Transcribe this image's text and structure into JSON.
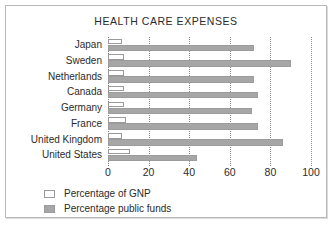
{
  "chart_data": {
    "type": "bar",
    "orientation": "horizontal",
    "title": "HEALTH CARE EXPENSES",
    "xlabel": "",
    "ylabel": "",
    "xlim": [
      0,
      100
    ],
    "xticks": [
      0,
      20,
      40,
      60,
      80,
      100
    ],
    "xtick_labels": [
      "0",
      "20",
      "40",
      "60",
      "80",
      "100"
    ],
    "grid": "vertical-dotted",
    "legend_position": "below-left",
    "categories": [
      "Japan",
      "Sweden",
      "Netherlands",
      "Canada",
      "Germany",
      "France",
      "United Kingdom",
      "United States"
    ],
    "series": [
      {
        "name": "Percentage of GNP",
        "color": "#ffffff",
        "edge_color": "#9a9a9a",
        "values": [
          7,
          8,
          8,
          8,
          8,
          9,
          7,
          11
        ]
      },
      {
        "name": "Percentage public funds",
        "color": "#a6a6a6",
        "edge_color": "#9c9c9c",
        "values": [
          72,
          90,
          72,
          74,
          71,
          74,
          86,
          44
        ]
      }
    ]
  },
  "colors": {
    "frame_border": "#b9b9b9",
    "text": "#2b2b2b",
    "gridline": "#8d8d8d",
    "bar_public": "#a6a6a6",
    "bar_gnp": "#ffffff"
  }
}
